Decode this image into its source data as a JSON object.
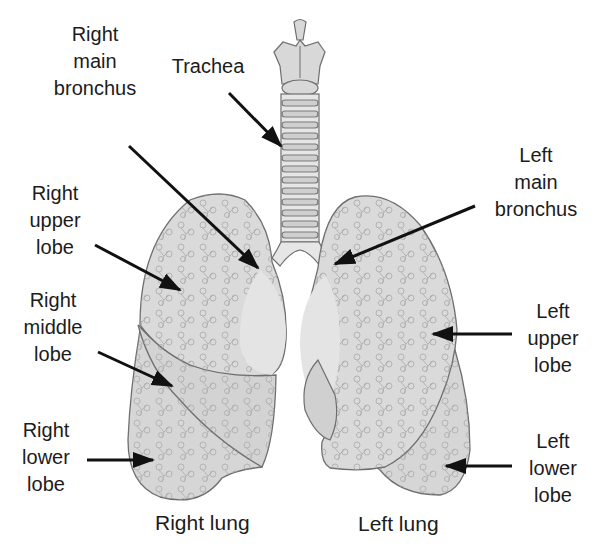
{
  "diagram": {
    "colors": {
      "background": "#ffffff",
      "lung_fill": "#dcdcdc",
      "lung_fill_dark": "#cfcfcf",
      "outline": "#6e6e6e",
      "bronchi_tree": "#9a9a9a",
      "arrow": "#111111",
      "text": "#1c1c1c"
    },
    "labels": {
      "right_main_bronchus": [
        "Right",
        "main",
        "bronchus"
      ],
      "trachea": [
        "Trachea"
      ],
      "right_upper_lobe": [
        "Right",
        "upper",
        "lobe"
      ],
      "right_middle_lobe": [
        "Right",
        "middle",
        "lobe"
      ],
      "right_lower_lobe": [
        "Right",
        "lower",
        "lobe"
      ],
      "left_main_bronchus": [
        "Left",
        "main",
        "bronchus"
      ],
      "left_upper_lobe": [
        "Left",
        "upper",
        "lobe"
      ],
      "left_lower_lobe": [
        "Left",
        "lower",
        "lobe"
      ]
    },
    "captions": {
      "right_lung": "Right lung",
      "left_lung": "Left lung"
    }
  }
}
